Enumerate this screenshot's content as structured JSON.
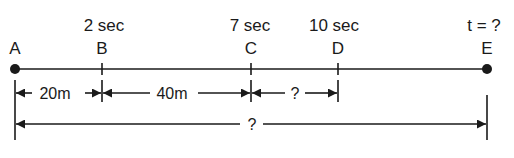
{
  "diagram": {
    "points": [
      {
        "id": "A",
        "label": "A",
        "time": "",
        "marker": "dot"
      },
      {
        "id": "B",
        "label": "B",
        "time": "2 sec",
        "marker": "tick"
      },
      {
        "id": "C",
        "label": "C",
        "time": "7 sec",
        "marker": "tick"
      },
      {
        "id": "D",
        "label": "D",
        "time": "10 sec",
        "marker": "tick"
      },
      {
        "id": "E",
        "label": "E",
        "time": "t = ?",
        "marker": "dot"
      }
    ],
    "segments": [
      {
        "from": "A",
        "to": "B",
        "label": "20m"
      },
      {
        "from": "B",
        "to": "C",
        "label": "40m"
      },
      {
        "from": "C",
        "to": "D",
        "label": "?"
      }
    ],
    "total": {
      "from": "A",
      "to": "E",
      "label": "?"
    },
    "color": "#1a1a1a"
  }
}
